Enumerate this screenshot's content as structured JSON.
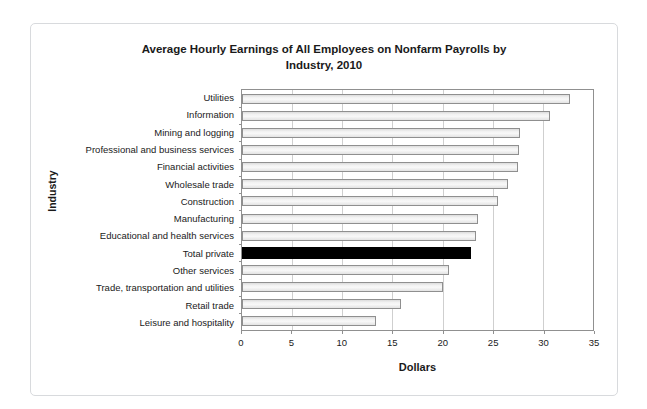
{
  "figure": {
    "title_line1": "Average Hourly Earnings of All Employees on Nonfarm Payrolls by",
    "title_line2": "Industry, 2010"
  },
  "chart_data": {
    "type": "bar",
    "orientation": "horizontal",
    "title": "Average Hourly Earnings of All Employees on Nonfarm Payrolls by Industry, 2010",
    "xlabel": "Dollars",
    "ylabel": "Industry",
    "xlim": [
      0,
      35
    ],
    "xticks": [
      0,
      5,
      10,
      15,
      20,
      25,
      30,
      35
    ],
    "grid": "vertical gridlines at each x tick, light gray",
    "legend": "none",
    "categories": [
      "Utilities",
      "Information",
      "Mining and logging",
      "Professional and business services",
      "Financial activities",
      "Wholesale trade",
      "Construction",
      "Manufacturing",
      "Educational and health services",
      "Total private",
      "Other services",
      "Trade, transportation and utilities",
      "Retail trade",
      "Leisure and hospitality"
    ],
    "values": [
      32.5,
      30.5,
      27.5,
      27.4,
      27.3,
      26.3,
      25.3,
      23.3,
      23.1,
      22.6,
      20.4,
      19.8,
      15.7,
      13.2
    ],
    "highlight": {
      "category": "Total private",
      "color": "#000000",
      "note": "solid black bar; all other bars light gray with gray border"
    },
    "colors": {
      "bar_fill": "#ececec",
      "bar_border": "#8f8f8f",
      "gridline": "#cfcfcf",
      "plot_border": "#909090",
      "figure_border": "#d8dadd",
      "text": "#1a1a1a"
    }
  }
}
